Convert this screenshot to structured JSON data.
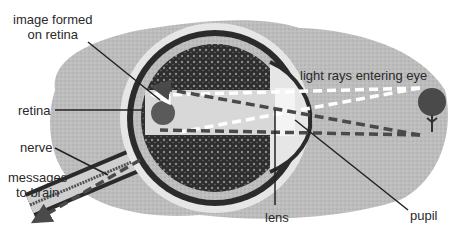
{
  "diagram": {
    "labels": {
      "image_formed_line1": "image formed",
      "image_formed_line2": "on retina",
      "retina": "retina",
      "nerve": "nerve",
      "messages_line1": "messages",
      "messages_line2": "to brain",
      "light_rays": "light rays entering eye",
      "lens": "lens",
      "pupil": "pupil"
    },
    "colors": {
      "background_blob": "#b9b9b9",
      "eye_outline": "#2b2b2b",
      "eye_fill_dark": "#333333",
      "chamber": "#d8d8d8",
      "ray_dark": "#4a4a4a",
      "ray_light": "#ffffff",
      "text": "#2a2a2a"
    },
    "objects": [
      "tree (object viewed)",
      "inverted tree image on retina"
    ]
  }
}
